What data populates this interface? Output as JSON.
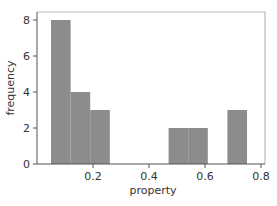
{
  "chart_data": {
    "type": "bar",
    "subtype": "histogram",
    "title": "",
    "xlabel": "property",
    "ylabel": "frequency",
    "xlim": [
      0.0,
      0.8
    ],
    "ylim": [
      0,
      8.5
    ],
    "x_ticks": [
      0.2,
      0.4,
      0.6,
      0.8
    ],
    "x_tick_labels": [
      "0.2",
      "0.4",
      "0.6",
      "0.8"
    ],
    "y_ticks": [
      0,
      2,
      4,
      6,
      8
    ],
    "y_tick_labels": [
      "0",
      "2",
      "4",
      "6",
      "8"
    ],
    "bins": [
      {
        "x0": 0.05,
        "x1": 0.12,
        "count": 8
      },
      {
        "x0": 0.12,
        "x1": 0.19,
        "count": 4
      },
      {
        "x0": 0.19,
        "x1": 0.26,
        "count": 3
      },
      {
        "x0": 0.26,
        "x1": 0.33,
        "count": 0
      },
      {
        "x0": 0.33,
        "x1": 0.4,
        "count": 0
      },
      {
        "x0": 0.4,
        "x1": 0.47,
        "count": 0
      },
      {
        "x0": 0.47,
        "x1": 0.54,
        "count": 2
      },
      {
        "x0": 0.54,
        "x1": 0.61,
        "count": 2
      },
      {
        "x0": 0.61,
        "x1": 0.68,
        "count": 0
      },
      {
        "x0": 0.68,
        "x1": 0.75,
        "count": 3
      }
    ],
    "categories": [
      "0.05-0.12",
      "0.12-0.19",
      "0.19-0.26",
      "0.26-0.33",
      "0.33-0.40",
      "0.40-0.47",
      "0.47-0.54",
      "0.54-0.61",
      "0.61-0.68",
      "0.68-0.75"
    ],
    "values": [
      8,
      4,
      3,
      0,
      0,
      0,
      2,
      2,
      0,
      3
    ],
    "grid": false,
    "legend": null,
    "colors": {
      "bar_fill": "#8c8c8c",
      "axis": "#555555",
      "frame": "#bbbbbb",
      "text": "#333333"
    }
  }
}
